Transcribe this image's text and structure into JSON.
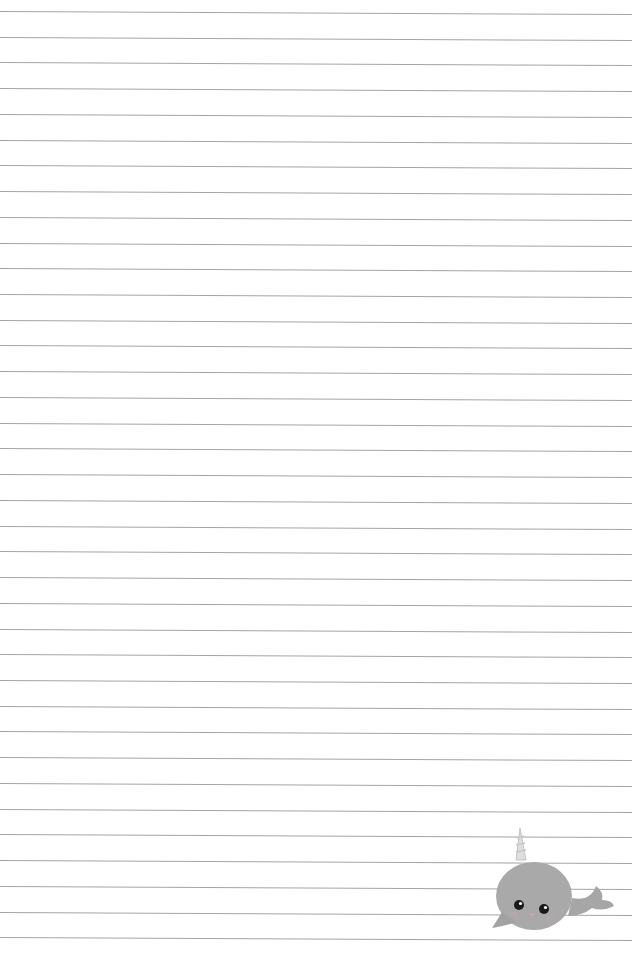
{
  "page": {
    "type": "lined-notepaper",
    "line_count": 37,
    "first_line_y": 11,
    "line_spacing": 25.73,
    "line_color": "#9a9a9a",
    "background_color": "#ffffff"
  },
  "decoration": {
    "icon": "narwhal-icon",
    "body_color": "#a9a9a9",
    "horn_color": "#d9d9d9"
  }
}
